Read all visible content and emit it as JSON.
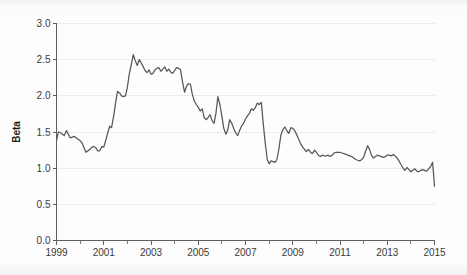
{
  "chart_data": {
    "type": "line",
    "title": "",
    "xlabel": "",
    "ylabel": "Beta",
    "xlim": [
      1999.0,
      2015.0
    ],
    "ylim": [
      0.0,
      3.0
    ],
    "grid": true,
    "legend": "none",
    "line_color": "#575757",
    "y_ticks": [
      "0.0",
      "0.5",
      "1.0",
      "1.5",
      "2.0",
      "2.5",
      "3.0"
    ],
    "y_tick_values": [
      0.0,
      0.5,
      1.0,
      1.5,
      2.0,
      2.5,
      3.0
    ],
    "x_ticks": [
      "1999",
      "2001",
      "2003",
      "2005",
      "2007",
      "2009",
      "2011",
      "2013",
      "2015"
    ],
    "x_tick_values": [
      1999,
      2001,
      2003,
      2005,
      2007,
      2009,
      2011,
      2013,
      2015
    ],
    "x_minor_ticks": [
      2000,
      2002,
      2004,
      2006,
      2008,
      2010,
      2012,
      2014
    ],
    "series": [
      {
        "name": "Beta",
        "x": [
          1999.0,
          1999.08,
          1999.17,
          1999.25,
          1999.33,
          1999.42,
          1999.5,
          1999.58,
          1999.67,
          1999.75,
          1999.83,
          1999.92,
          2000.0,
          2000.08,
          2000.17,
          2000.25,
          2000.33,
          2000.42,
          2000.5,
          2000.58,
          2000.67,
          2000.75,
          2000.83,
          2000.92,
          2001.0,
          2001.08,
          2001.17,
          2001.25,
          2001.33,
          2001.42,
          2001.5,
          2001.58,
          2001.67,
          2001.75,
          2001.83,
          2001.92,
          2002.0,
          2002.08,
          2002.17,
          2002.25,
          2002.33,
          2002.42,
          2002.5,
          2002.58,
          2002.67,
          2002.75,
          2002.83,
          2002.92,
          2003.0,
          2003.08,
          2003.17,
          2003.25,
          2003.33,
          2003.42,
          2003.5,
          2003.58,
          2003.67,
          2003.75,
          2003.83,
          2003.92,
          2004.0,
          2004.08,
          2004.17,
          2004.25,
          2004.33,
          2004.42,
          2004.5,
          2004.58,
          2004.67,
          2004.75,
          2004.83,
          2004.92,
          2005.0,
          2005.08,
          2005.17,
          2005.25,
          2005.33,
          2005.42,
          2005.5,
          2005.58,
          2005.67,
          2005.75,
          2005.83,
          2005.92,
          2006.0,
          2006.08,
          2006.17,
          2006.25,
          2006.33,
          2006.42,
          2006.5,
          2006.58,
          2006.67,
          2006.75,
          2006.83,
          2006.92,
          2007.0,
          2007.08,
          2007.17,
          2007.25,
          2007.33,
          2007.42,
          2007.5,
          2007.58,
          2007.67,
          2007.75,
          2007.83,
          2007.92,
          2008.0,
          2008.08,
          2008.17,
          2008.25,
          2008.33,
          2008.42,
          2008.5,
          2008.58,
          2008.67,
          2008.75,
          2008.83,
          2008.92,
          2009.0,
          2009.08,
          2009.17,
          2009.25,
          2009.33,
          2009.42,
          2009.5,
          2009.58,
          2009.67,
          2009.75,
          2009.83,
          2009.92,
          2010.0,
          2010.08,
          2010.17,
          2010.25,
          2010.33,
          2010.42,
          2010.5,
          2010.58,
          2010.67,
          2010.75,
          2010.83,
          2010.92,
          2011.0,
          2011.08,
          2011.17,
          2011.25,
          2011.33,
          2011.42,
          2011.5,
          2011.58,
          2011.67,
          2011.75,
          2011.83,
          2011.92,
          2012.0,
          2012.08,
          2012.17,
          2012.25,
          2012.33,
          2012.42,
          2012.5,
          2012.58,
          2012.67,
          2012.75,
          2012.83,
          2012.92,
          2013.0,
          2013.08,
          2013.17,
          2013.25,
          2013.33,
          2013.42,
          2013.5,
          2013.58,
          2013.67,
          2013.75,
          2013.83,
          2013.92,
          2014.0,
          2014.08,
          2014.17,
          2014.25,
          2014.33,
          2014.42,
          2014.5,
          2014.58,
          2014.67,
          2014.75,
          2014.83,
          2014.92,
          2015.0
        ],
        "values": [
          1.38,
          1.5,
          1.49,
          1.47,
          1.45,
          1.52,
          1.47,
          1.42,
          1.43,
          1.44,
          1.42,
          1.4,
          1.38,
          1.35,
          1.28,
          1.22,
          1.24,
          1.26,
          1.29,
          1.3,
          1.28,
          1.24,
          1.24,
          1.3,
          1.29,
          1.38,
          1.49,
          1.58,
          1.56,
          1.72,
          1.9,
          2.06,
          2.04,
          2.0,
          1.99,
          2.0,
          2.12,
          2.3,
          2.44,
          2.57,
          2.49,
          2.42,
          2.5,
          2.46,
          2.4,
          2.35,
          2.32,
          2.36,
          2.3,
          2.31,
          2.36,
          2.38,
          2.39,
          2.34,
          2.37,
          2.4,
          2.34,
          2.37,
          2.33,
          2.31,
          2.35,
          2.39,
          2.38,
          2.36,
          2.2,
          2.05,
          2.13,
          2.17,
          2.16,
          2.02,
          1.93,
          1.88,
          1.84,
          1.79,
          1.82,
          1.7,
          1.67,
          1.7,
          1.74,
          1.66,
          1.62,
          1.76,
          1.99,
          1.87,
          1.72,
          1.55,
          1.47,
          1.53,
          1.67,
          1.62,
          1.55,
          1.49,
          1.45,
          1.52,
          1.58,
          1.62,
          1.68,
          1.72,
          1.76,
          1.82,
          1.8,
          1.84,
          1.9,
          1.88,
          1.91,
          1.62,
          1.36,
          1.12,
          1.06,
          1.1,
          1.09,
          1.08,
          1.12,
          1.28,
          1.46,
          1.53,
          1.57,
          1.52,
          1.48,
          1.56,
          1.55,
          1.52,
          1.46,
          1.4,
          1.34,
          1.29,
          1.26,
          1.23,
          1.26,
          1.22,
          1.2,
          1.25,
          1.22,
          1.18,
          1.16,
          1.18,
          1.17,
          1.17,
          1.18,
          1.16,
          1.18,
          1.21,
          1.22,
          1.22,
          1.22,
          1.21,
          1.2,
          1.19,
          1.18,
          1.17,
          1.16,
          1.14,
          1.12,
          1.11,
          1.1,
          1.12,
          1.15,
          1.23,
          1.31,
          1.26,
          1.18,
          1.14,
          1.16,
          1.18,
          1.17,
          1.16,
          1.15,
          1.16,
          1.18,
          1.18,
          1.17,
          1.19,
          1.17,
          1.14,
          1.1,
          1.05,
          1.0,
          0.97,
          1.01,
          0.98,
          0.95,
          0.97,
          0.99,
          0.96,
          0.95,
          0.97,
          0.98,
          0.97,
          0.96,
          0.99,
          1.02,
          1.08,
          0.75
        ]
      }
    ]
  }
}
